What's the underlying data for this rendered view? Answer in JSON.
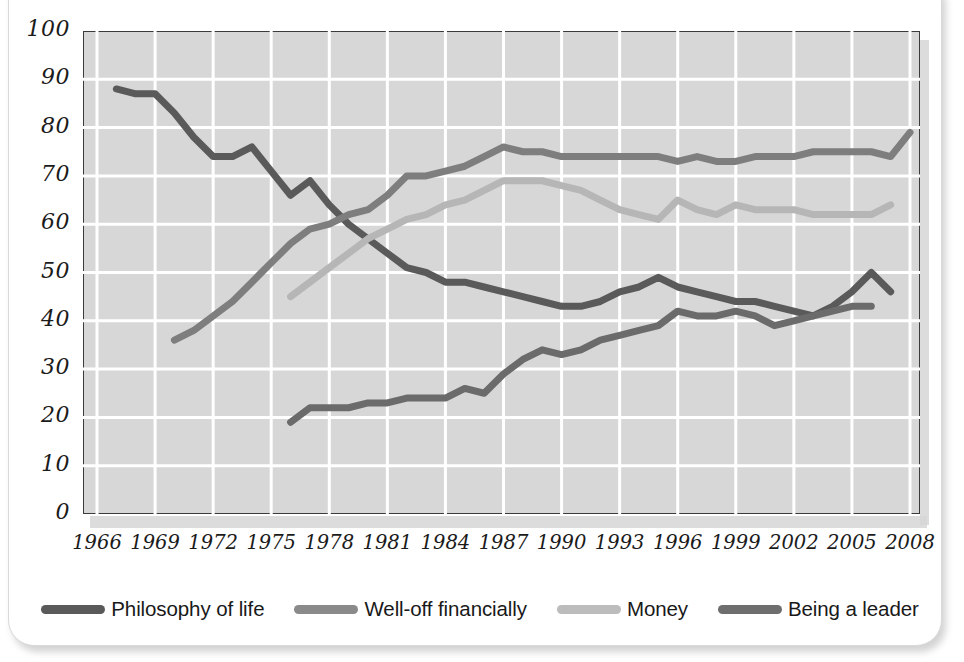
{
  "chart_data": {
    "type": "line",
    "title": "",
    "xlabel": "",
    "ylabel": "",
    "xlim": [
      1966,
      2008
    ],
    "ylim": [
      0,
      100
    ],
    "grid": true,
    "legend_position": "bottom",
    "x_ticks": [
      "1966",
      "1969",
      "1972",
      "1975",
      "1978",
      "1981",
      "1984",
      "1987",
      "1990",
      "1993",
      "1996",
      "1999",
      "2002",
      "2005",
      "2008"
    ],
    "y_ticks": [
      "0",
      "10",
      "20",
      "30",
      "40",
      "50",
      "60",
      "70",
      "80",
      "90",
      "100"
    ],
    "series": [
      {
        "name": "Philosophy of life",
        "color": "#5a5a5a",
        "x": [
          1967,
          1968,
          1969,
          1970,
          1971,
          1972,
          1973,
          1974,
          1975,
          1976,
          1977,
          1978,
          1979,
          1980,
          1981,
          1982,
          1983,
          1984,
          1985,
          1986,
          1987,
          1988,
          1989,
          1990,
          1991,
          1992,
          1993,
          1994,
          1995,
          1996,
          1997,
          1998,
          1999,
          2000,
          2001,
          2002,
          2003,
          2004,
          2005,
          2006,
          2007
        ],
        "values": [
          88,
          87,
          87,
          83,
          78,
          74,
          74,
          76,
          71,
          66,
          69,
          64,
          60,
          57,
          54,
          51,
          50,
          48,
          48,
          47,
          46,
          45,
          44,
          43,
          43,
          44,
          46,
          47,
          49,
          47,
          46,
          45,
          44,
          44,
          43,
          42,
          41,
          43,
          46,
          50,
          46
        ]
      },
      {
        "name": "Well-off financially",
        "color": "#7e7e7e",
        "x": [
          1970,
          1971,
          1972,
          1973,
          1974,
          1975,
          1976,
          1977,
          1978,
          1979,
          1980,
          1981,
          1982,
          1983,
          1984,
          1985,
          1986,
          1987,
          1988,
          1989,
          1990,
          1991,
          1992,
          1993,
          1994,
          1995,
          1996,
          1997,
          1998,
          1999,
          2000,
          2001,
          2002,
          2003,
          2004,
          2005,
          2006,
          2007,
          2008
        ],
        "values": [
          36,
          38,
          41,
          44,
          48,
          52,
          56,
          59,
          60,
          62,
          63,
          66,
          70,
          70,
          71,
          72,
          74,
          76,
          75,
          75,
          74,
          74,
          74,
          74,
          74,
          74,
          73,
          74,
          73,
          73,
          74,
          74,
          74,
          75,
          75,
          75,
          75,
          74,
          79
        ]
      },
      {
        "name": "Money",
        "color": "#b6b6b6",
        "x": [
          1976,
          1977,
          1978,
          1979,
          1980,
          1981,
          1982,
          1983,
          1984,
          1985,
          1986,
          1987,
          1988,
          1989,
          1990,
          1991,
          1992,
          1993,
          1994,
          1995,
          1996,
          1997,
          1998,
          1999,
          2000,
          2001,
          2002,
          2003,
          2004,
          2005,
          2006,
          2007
        ],
        "values": [
          45,
          48,
          51,
          54,
          57,
          59,
          61,
          62,
          64,
          65,
          67,
          69,
          69,
          69,
          68,
          67,
          65,
          63,
          62,
          61,
          65,
          63,
          62,
          64,
          63,
          63,
          63,
          62,
          62,
          62,
          62,
          64
        ]
      },
      {
        "name": "Being a leader",
        "color": "#6b6b6b",
        "x": [
          1976,
          1977,
          1978,
          1979,
          1980,
          1981,
          1982,
          1983,
          1984,
          1985,
          1986,
          1987,
          1988,
          1989,
          1990,
          1991,
          1992,
          1993,
          1994,
          1995,
          1996,
          1997,
          1998,
          1999,
          2000,
          2001,
          2002,
          2003,
          2004,
          2005,
          2006
        ],
        "values": [
          19,
          22,
          22,
          22,
          23,
          23,
          24,
          24,
          24,
          26,
          25,
          29,
          32,
          34,
          33,
          34,
          36,
          37,
          38,
          39,
          42,
          41,
          41,
          42,
          41,
          39,
          40,
          41,
          42,
          43,
          43
        ]
      }
    ]
  },
  "legend": {
    "items": [
      {
        "label": "Philosophy of life",
        "color": "#5a5a5a"
      },
      {
        "label": "Well-off financially",
        "color": "#8a8a8a"
      },
      {
        "label": "Money",
        "color": "#bcbcbc"
      },
      {
        "label": "Being a leader",
        "color": "#6e6e6e"
      }
    ]
  },
  "style": {
    "plot_background": "#d7d7d7",
    "grid_color": "#ffffff",
    "frame_color": "#3b3b3b",
    "text_color": "#1b1b1b"
  }
}
